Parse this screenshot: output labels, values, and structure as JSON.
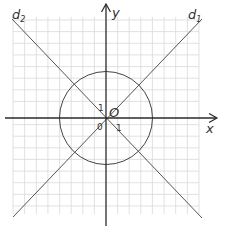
{
  "figure": {
    "labels": {
      "x_axis": "x",
      "y_axis": "y",
      "origin": "O",
      "zero": "0",
      "unit_x": "1",
      "unit_y": "1",
      "line1": "d",
      "line1_sub": "1",
      "line2": "d",
      "line2_sub": "2"
    },
    "colors": {
      "grid": "#d9d9d9",
      "axes": "#2a2a2a",
      "lines": "#555555",
      "circle": "#444444"
    },
    "geometry": {
      "grid_range": [
        -8,
        8
      ],
      "circle_center": [
        0,
        0
      ],
      "circle_radius": 4,
      "line1_equation": "y = x",
      "line2_equation": "y = -x"
    }
  }
}
